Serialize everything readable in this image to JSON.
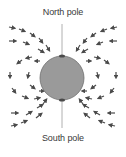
{
  "diagram": {
    "labels": {
      "north": "North pole",
      "south": "South pole"
    },
    "colors": {
      "planet_fill": "#9a9a9a",
      "planet_stroke": "#6e6e6e",
      "axis": "#b0b0b0",
      "arrow": "#4a4a4a",
      "text": "#3a3a3a"
    },
    "planet": {
      "cx": 62,
      "cy": 78,
      "r": 22
    },
    "axis": {
      "x": 62,
      "y1": 24,
      "y2": 128
    }
  }
}
